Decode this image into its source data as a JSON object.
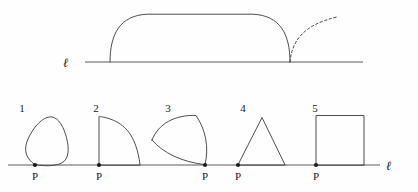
{
  "figure": {
    "background_color": "#fefefe",
    "stroke_color": "#3a3a3a",
    "line_color": "#4a4a4a",
    "point_color": "#1b1b1b",
    "width": 418,
    "height": 192
  },
  "top_panel": {
    "line_label": "ℓ",
    "line": {
      "x1": 85,
      "y": 62,
      "x2": 363
    },
    "label_position": {
      "x": 68,
      "y": 66
    },
    "shape": {
      "name": "convex-dome",
      "left_contact_x": 110,
      "right_contact_x": 290,
      "apex_y": 14,
      "description": "convex rounded dome resting on line"
    },
    "dashed_curve": {
      "name": "tangent-arc",
      "start": {
        "x": 290,
        "y": 62
      },
      "end": {
        "x": 337,
        "y": 17
      },
      "description": "dashed arc rising from right contact point"
    }
  },
  "bottom_panel": {
    "line_label": "ℓ",
    "line": {
      "x1": 8,
      "y": 165,
      "x2": 380
    },
    "label_position": {
      "x": 389,
      "y": 169
    },
    "point_label": "P",
    "shapes": [
      {
        "number": "1",
        "name": "rounded-triangle",
        "number_position": {
          "x": 25,
          "y": 108
        },
        "contact_x": 35,
        "point_label_position": {
          "x": 35,
          "y": 179
        }
      },
      {
        "number": "2",
        "name": "quarter-circle",
        "number_position": {
          "x": 96,
          "y": 108
        },
        "contact_x": 99,
        "point_label_position": {
          "x": 99,
          "y": 179
        }
      },
      {
        "number": "3",
        "name": "reuleaux-triangle",
        "number_position": {
          "x": 168,
          "y": 108
        },
        "contact_x": 205,
        "point_label_position": {
          "x": 205,
          "y": 179
        }
      },
      {
        "number": "4",
        "name": "triangle",
        "number_position": {
          "x": 241,
          "y": 108
        },
        "contact_x": 238,
        "point_label_position": {
          "x": 238,
          "y": 179
        }
      },
      {
        "number": "5",
        "name": "square",
        "number_position": {
          "x": 313,
          "y": 108
        },
        "contact_x": 316,
        "point_label_position": {
          "x": 316,
          "y": 179
        }
      }
    ]
  }
}
